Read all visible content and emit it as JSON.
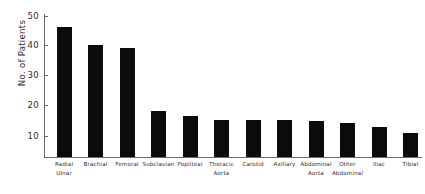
{
  "chart_data": {
    "type": "bar",
    "title": "",
    "xlabel": "",
    "ylabel": "No. of Patients",
    "ylim": [
      0,
      50
    ],
    "yticks": [
      10,
      20,
      30,
      40,
      50
    ],
    "grid": false,
    "legend": null,
    "bar_color": "#0b0b0b",
    "axis_color": "#6a6a6a",
    "categories": [
      "Radial Ulnar",
      "Brachial",
      "Femoral",
      "Subclavian",
      "Popliteal",
      "Thoracic Aorta",
      "Carotid",
      "Axillary",
      "Abdominal Aorta",
      "Other Abdominal",
      "Iliac",
      "Tibial"
    ],
    "category_lines": [
      [
        "Radial",
        "Ulnar"
      ],
      [
        "Brachial",
        ""
      ],
      [
        "Femoral",
        ""
      ],
      [
        "Subclavian",
        ""
      ],
      [
        "Popliteal",
        ""
      ],
      [
        "Thoracic",
        "Aorta"
      ],
      [
        "Carotid",
        ""
      ],
      [
        "Axillary",
        ""
      ],
      [
        "Abdominal",
        "Aorta"
      ],
      [
        "Other",
        "Abdominal"
      ],
      [
        "Iliac",
        ""
      ],
      [
        "Tibial",
        ""
      ]
    ],
    "values": [
      45.5,
      39,
      38,
      16,
      14.5,
      13,
      13,
      13,
      12.5,
      12,
      10.5,
      8.5
    ]
  },
  "axis": {
    "y_label": "No. of Patients",
    "tick_50": "50",
    "tick_40": "40",
    "tick_30": "30",
    "tick_20": "20",
    "tick_10": "10"
  },
  "labels": {
    "c0_l1": "Radial",
    "c0_l2": "Ulnar",
    "c1_l1": "Brachial",
    "c1_l2": "",
    "c2_l1": "Femoral",
    "c2_l2": "",
    "c3_l1": "Subclavian",
    "c3_l2": "",
    "c4_l1": "Popliteal",
    "c4_l2": "",
    "c5_l1": "Thoracic",
    "c5_l2": "Aorta",
    "c6_l1": "Carotid",
    "c6_l2": "",
    "c7_l1": "Axillary",
    "c7_l2": "",
    "c8_l1": "Abdominal",
    "c8_l2": "Aorta",
    "c9_l1": "Other",
    "c9_l2": "Abdominal",
    "c10_l1": "Iliac",
    "c10_l2": "",
    "c11_l1": "Tibial",
    "c11_l2": ""
  }
}
